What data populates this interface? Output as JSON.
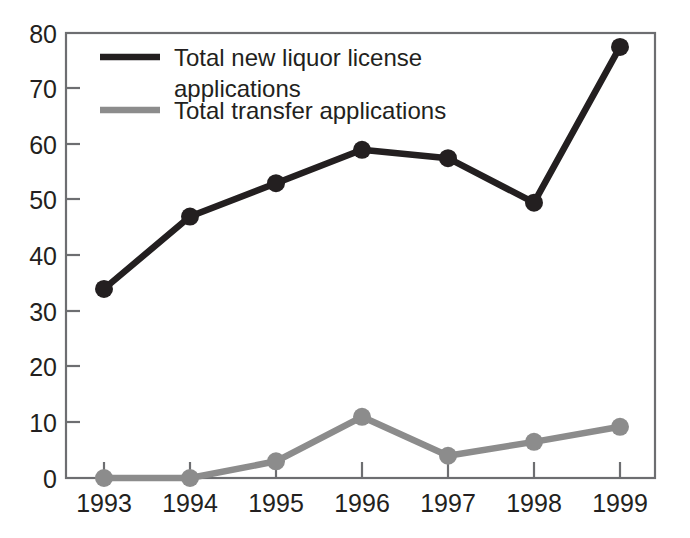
{
  "chart_data": {
    "type": "line",
    "title": "",
    "subtitle": "",
    "xlabel": "",
    "ylabel": "",
    "categories": [
      "1993",
      "1994",
      "1995",
      "1996",
      "1997",
      "1998",
      "1999"
    ],
    "x": [
      1993,
      1994,
      1995,
      1996,
      1997,
      1998,
      1999
    ],
    "xlim": [
      1993,
      1999
    ],
    "ylim": [
      0,
      80
    ],
    "yticks": [
      0,
      10,
      20,
      30,
      40,
      50,
      60,
      70,
      80
    ],
    "ytick_labels": [
      "0",
      "10",
      "20",
      "30",
      "40",
      "50",
      "60",
      "70",
      "80"
    ],
    "xtick_labels": [
      "1993",
      "1994",
      "1995",
      "1996",
      "1997",
      "1998",
      "1999"
    ],
    "grid": false,
    "legend_position": "inside-top-left",
    "markers": "circle",
    "series": [
      {
        "name": "Total new liquor license applications",
        "color": "#231f20",
        "values": [
          34,
          47,
          53,
          59,
          57.5,
          49.5,
          77.5
        ]
      },
      {
        "name": "Total transfer applications",
        "color": "#8c8c8c",
        "values": [
          0,
          0,
          3,
          11,
          4,
          6.5,
          9.2
        ]
      }
    ]
  },
  "legend": {
    "entries": [
      {
        "label_line1": "Total new liquor license",
        "label_line2": "applications",
        "color": "#231f20"
      },
      {
        "label_line1": "Total transfer applications",
        "label_line2": "",
        "color": "#8c8c8c"
      }
    ]
  },
  "axes": {
    "frame_color": "#6d6e71",
    "tick_color": "#6d6e71",
    "text_color": "#231f20"
  },
  "canvas": {
    "background": "#ffffff",
    "width": 690,
    "height": 538
  }
}
